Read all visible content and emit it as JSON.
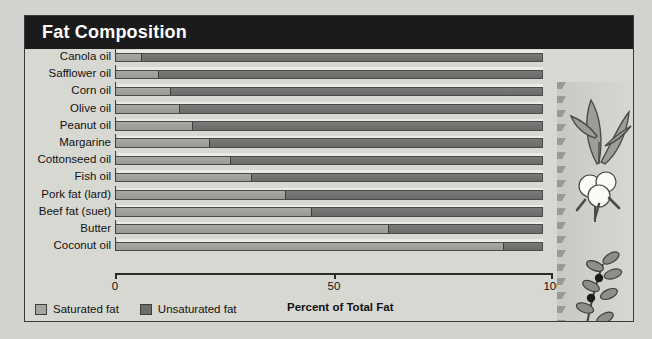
{
  "panel": {
    "title": "Fat Composition"
  },
  "chart_data": {
    "type": "bar",
    "subtype": "stacked-horizontal-100",
    "title": "Fat Composition",
    "xlabel": "Percent of Total Fat",
    "ylabel": "",
    "xlim": [
      0,
      100
    ],
    "xticks": [
      0,
      50,
      100
    ],
    "xticklabels": [
      "0",
      "50",
      "100"
    ],
    "grid": false,
    "legend_position": "bottom-left",
    "categories": [
      "Canola oil",
      "Safflower oil",
      "Corn oil",
      "Olive oil",
      "Peanut oil",
      "Margarine",
      "Cottonseed oil",
      "Fish oil",
      "Pork fat (lard)",
      "Beef fat (suet)",
      "Butter",
      "Coconut oil"
    ],
    "series": [
      {
        "name": "Saturated fat",
        "color": "#a5a5a0",
        "values": [
          6,
          10,
          13,
          15,
          18,
          22,
          27,
          32,
          40,
          46,
          64,
          91
        ]
      },
      {
        "name": "Unsaturated fat",
        "color": "#6d6d6b",
        "values": [
          94,
          90,
          87,
          85,
          82,
          78,
          73,
          68,
          60,
          54,
          36,
          9
        ]
      }
    ]
  },
  "legend": {
    "items": [
      {
        "label": "Saturated fat",
        "color": "#a5a5a0"
      },
      {
        "label": "Unsaturated fat",
        "color": "#6d6d6b"
      }
    ]
  },
  "axis": {
    "x_title": "Percent of Total Fat"
  },
  "artwork": {
    "items": [
      "corn-plant",
      "cotton-boll",
      "olive-branch"
    ]
  }
}
